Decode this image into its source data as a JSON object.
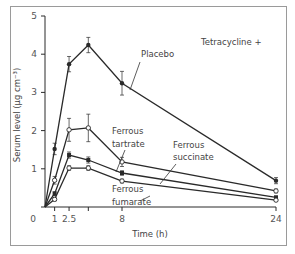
{
  "chart_data": {
    "type": "line",
    "title": "Tetracycline +",
    "xlabel": "Time (h)",
    "ylabel": "Serum level (µg cm⁻³)",
    "xlim": [
      0,
      24
    ],
    "ylim": [
      0,
      5
    ],
    "x_ticks": [
      0,
      1,
      2.5,
      4.5,
      8,
      24
    ],
    "x_tick_labels": [
      "0",
      "1",
      "2.5",
      "",
      "8",
      "24"
    ],
    "y_ticks": [
      0,
      1,
      2,
      3,
      4,
      5
    ],
    "y_tick_labels": [
      "",
      "1",
      "2",
      "3",
      "4",
      "5"
    ],
    "grid": false,
    "legend": "inline annotations",
    "x": [
      0,
      1,
      2.5,
      4.5,
      8,
      24
    ],
    "series": [
      {
        "name": "Placebo",
        "marker": "filled-circle",
        "values": [
          0,
          1.52,
          3.74,
          4.24,
          3.24,
          0.69
        ],
        "errors": [
          0,
          0.15,
          0.2,
          0.2,
          0.31,
          0.08
        ]
      },
      {
        "name": "Ferrous tartrate",
        "marker": "open-circle",
        "values": [
          0,
          0.7,
          2.02,
          2.07,
          1.18,
          0.42
        ],
        "errors": [
          0,
          0.1,
          0.3,
          0.36,
          0.12,
          0.05
        ]
      },
      {
        "name": "Ferrous succinate",
        "marker": "filled-square",
        "values": [
          0,
          0.35,
          1.36,
          1.23,
          0.89,
          0.25
        ],
        "errors": [
          0,
          0.05,
          0.08,
          0.08,
          0.06,
          0.04
        ]
      },
      {
        "name": "Ferrous fumarate",
        "marker": "open-circle",
        "values": [
          0,
          0.2,
          1.02,
          1.02,
          0.68,
          0.18
        ],
        "errors": [
          0,
          0.04,
          0.06,
          0.06,
          0.05,
          0.03
        ]
      }
    ],
    "annotations": [
      {
        "text": "Placebo",
        "target_series": "Placebo"
      },
      {
        "text": "Ferrous",
        "line2": "tartrate",
        "target_series": "Ferrous tartrate"
      },
      {
        "text": "Ferrous",
        "line2": "succinate",
        "target_series": "Ferrous succinate"
      },
      {
        "text": "Ferrous",
        "line2": "fumarate",
        "target_series": "Ferrous fumarate"
      }
    ]
  },
  "colors": {
    "line": "#2a2a2a",
    "frame": "#9a9a9a",
    "text": "#444444"
  }
}
